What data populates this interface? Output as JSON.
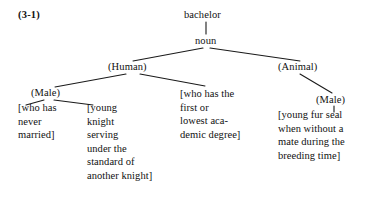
{
  "figure": {
    "reference_label": "(3-1)",
    "headword": "bachelor",
    "part_of_speech": "noun",
    "branch_human": "(Human)",
    "branch_animal": "(Animal)",
    "feature_male_human": "(Male)",
    "feature_male_animal": "(Male)",
    "gloss_bachelor_unmarried": {
      "line1": "[who has",
      "line2": "never",
      "line3": "married]"
    },
    "gloss_bachelor_knight": {
      "line1": "[young",
      "line2": "knight",
      "line3": "serving",
      "line4": "under the",
      "line5": "standard of",
      "line6": "another knight]"
    },
    "gloss_bachelor_degree": {
      "line1": "[who has the",
      "line2": "first or",
      "line3": "lowest aca-",
      "line4": "demic degree]"
    },
    "gloss_bachelor_seal": {
      "line1": "[young fur seal",
      "line2": "when without a",
      "line3": "mate during the",
      "line4": "breeding time]"
    }
  },
  "colors": {
    "background": "#ffffff",
    "text": "#111111",
    "edge": "#1a1a1a"
  }
}
